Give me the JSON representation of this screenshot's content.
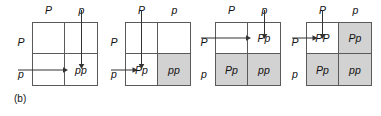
{
  "figure": {
    "caption": "(b)",
    "shade_color": "#d2d2d2",
    "line_color": "#5a5a5a",
    "text_color": "#111111",
    "panels": [
      {
        "name": "punnett-square-1",
        "col_headers": [
          "P",
          "p"
        ],
        "row_headers": [
          "P",
          "p"
        ],
        "cells": [
          {
            "label": "",
            "shaded": false
          },
          {
            "label": "",
            "shaded": false
          },
          {
            "label": "",
            "shaded": false
          },
          {
            "label": "pp",
            "shaded": false
          }
        ],
        "arrows": [
          {
            "name": "vertical-arrow-p",
            "dir": "down",
            "column": "right"
          },
          {
            "name": "horizontal-arrow-p",
            "dir": "right",
            "row": "bottom"
          }
        ]
      },
      {
        "name": "punnett-square-2",
        "col_headers": [
          "P",
          "p"
        ],
        "row_headers": [
          "P",
          "p"
        ],
        "cells": [
          {
            "label": "",
            "shaded": false
          },
          {
            "label": "",
            "shaded": false
          },
          {
            "label": "Pp",
            "shaded": false
          },
          {
            "label": "pp",
            "shaded": true
          }
        ],
        "arrows": [
          {
            "name": "vertical-arrow-P",
            "dir": "down",
            "column": "left"
          },
          {
            "name": "horizontal-arrow-p",
            "dir": "right",
            "row": "bottom"
          }
        ]
      },
      {
        "name": "punnett-square-3",
        "col_headers": [
          "P",
          "p"
        ],
        "row_headers": [
          "P",
          "p"
        ],
        "cells": [
          {
            "label": "",
            "shaded": false
          },
          {
            "label": "Pp",
            "shaded": false
          },
          {
            "label": "Pp",
            "shaded": true
          },
          {
            "label": "pp",
            "shaded": true
          }
        ],
        "arrows": [
          {
            "name": "vertical-arrow-p",
            "dir": "down",
            "column": "right"
          },
          {
            "name": "horizontal-arrow-P",
            "dir": "right",
            "row": "top"
          }
        ]
      },
      {
        "name": "punnett-square-4",
        "col_headers": [
          "P",
          "p"
        ],
        "row_headers": [
          "P",
          "p"
        ],
        "cells": [
          {
            "label": "PP",
            "shaded": false
          },
          {
            "label": "Pp",
            "shaded": true
          },
          {
            "label": "Pp",
            "shaded": true
          },
          {
            "label": "pp",
            "shaded": true
          }
        ],
        "arrows": [
          {
            "name": "vertical-arrow-P",
            "dir": "down",
            "column": "left"
          },
          {
            "name": "horizontal-arrow-P",
            "dir": "right",
            "row": "top"
          }
        ]
      }
    ]
  }
}
